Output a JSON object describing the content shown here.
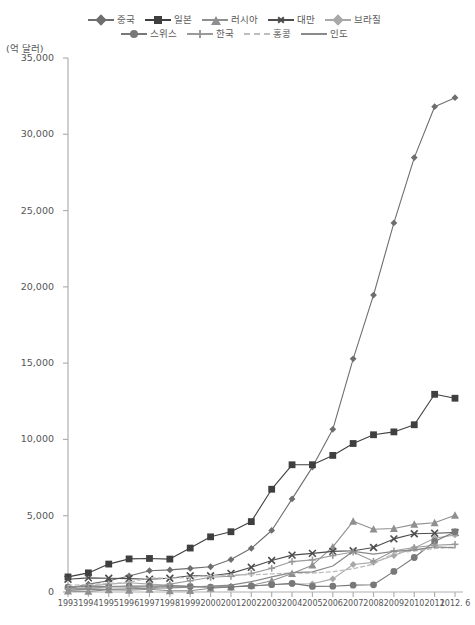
{
  "chart_data": {
    "type": "line",
    "title": "",
    "subtitle": "",
    "xlabel": "",
    "ylabel": "(억 달러)",
    "unit_label": "(억 달러)",
    "grid": false,
    "legend_position": "top",
    "ylim": [
      0,
      35000
    ],
    "ytick_values": [
      0,
      5000,
      10000,
      15000,
      20000,
      25000,
      30000,
      35000
    ],
    "ytick_labels": [
      "0",
      "5,000",
      "10,000",
      "15,000",
      "20,000",
      "25,000",
      "30,000",
      "35,000"
    ],
    "categories": [
      "1993",
      "1994",
      "1995",
      "1996",
      "1997",
      "1998",
      "1999",
      "2000",
      "2001",
      "2002",
      "2003",
      "2004",
      "2005",
      "2006",
      "2007",
      "2008",
      "2009",
      "2010",
      "2011",
      "2012. 6"
    ],
    "x": [
      "1993",
      "1994",
      "1995",
      "1996",
      "1997",
      "1998",
      "1999",
      "2000",
      "2001",
      "2002",
      "2003",
      "2004",
      "2005",
      "2006",
      "2007",
      "2008",
      "2009",
      "2010",
      "2011",
      "2012. 6"
    ],
    "series": [
      {
        "name": "중국",
        "marker": "diamond",
        "color": "#6e6e6e",
        "dash": "none",
        "values": [
          212,
          516,
          736,
          1050,
          1399,
          1450,
          1547,
          1656,
          2122,
          2864,
          4033,
          6099,
          8189,
          10663,
          15282,
          19460,
          24191,
          28473,
          31811,
          32400
        ]
      },
      {
        "name": "일본",
        "marker": "square",
        "color": "#3f3f3f",
        "dash": "none",
        "values": [
          988,
          1254,
          1831,
          2169,
          2198,
          2159,
          2880,
          3616,
          3950,
          4613,
          6735,
          8339,
          8342,
          8953,
          9733,
          10306,
          10494,
          10962,
          12958,
          12700
        ]
      },
      {
        "name": "러시아",
        "marker": "triangle",
        "color": "#8f8f8f",
        "dash": "none",
        "values": [
          60,
          40,
          148,
          114,
          179,
          77,
          85,
          245,
          325,
          440,
          735,
          1205,
          1755,
          2955,
          4636,
          4116,
          4163,
          4433,
          4536,
          5030
        ]
      },
      {
        "name": "대만",
        "marker": "x",
        "color": "#4d4d4d",
        "dash": "none",
        "values": [
          835,
          924,
          903,
          880,
          834,
          903,
          1062,
          1067,
          1222,
          1617,
          2066,
          2417,
          2532,
          2661,
          2703,
          2917,
          3482,
          3820,
          3856,
          3900
        ]
      },
      {
        "name": "브라질",
        "marker": "diamond-light",
        "color": "#a8a8a8",
        "dash": "none",
        "values": [
          320,
          385,
          515,
          600,
          520,
          445,
          361,
          330,
          359,
          378,
          492,
          527,
          537,
          857,
          1801,
          1937,
          2385,
          2887,
          3522,
          3740
        ]
      },
      {
        "name": "스위스",
        "marker": "circle",
        "color": "#787878",
        "dash": "none",
        "values": [
          325,
          346,
          363,
          384,
          389,
          398,
          367,
          324,
          325,
          400,
          479,
          562,
          364,
          382,
          449,
          470,
          1350,
          2260,
          3310,
          3950
        ]
      },
      {
        "name": "한국",
        "marker": "plus",
        "color": "#9a9a9a",
        "dash": "none",
        "values": [
          202,
          257,
          327,
          332,
          204,
          520,
          740,
          962,
          1028,
          1214,
          1553,
          1991,
          2104,
          2390,
          2622,
          2012,
          2700,
          2916,
          3064,
          3122
        ]
      },
      {
        "name": "홍콩",
        "marker": "none",
        "color": "#bdbdbd",
        "dash": "dashed",
        "values": [
          430,
          490,
          553,
          639,
          928,
          897,
          963,
          1075,
          1112,
          1118,
          1184,
          1237,
          1243,
          1331,
          1527,
          1825,
          2558,
          2685,
          2854,
          2950
        ]
      },
      {
        "name": "인도",
        "marker": "none",
        "color": "#8a8a8a",
        "dash": "none",
        "values": [
          105,
          196,
          176,
          201,
          251,
          276,
          323,
          379,
          455,
          677,
          988,
          1266,
          1316,
          1705,
          2665,
          2475,
          2658,
          2750,
          2964,
          2900
        ]
      }
    ]
  }
}
